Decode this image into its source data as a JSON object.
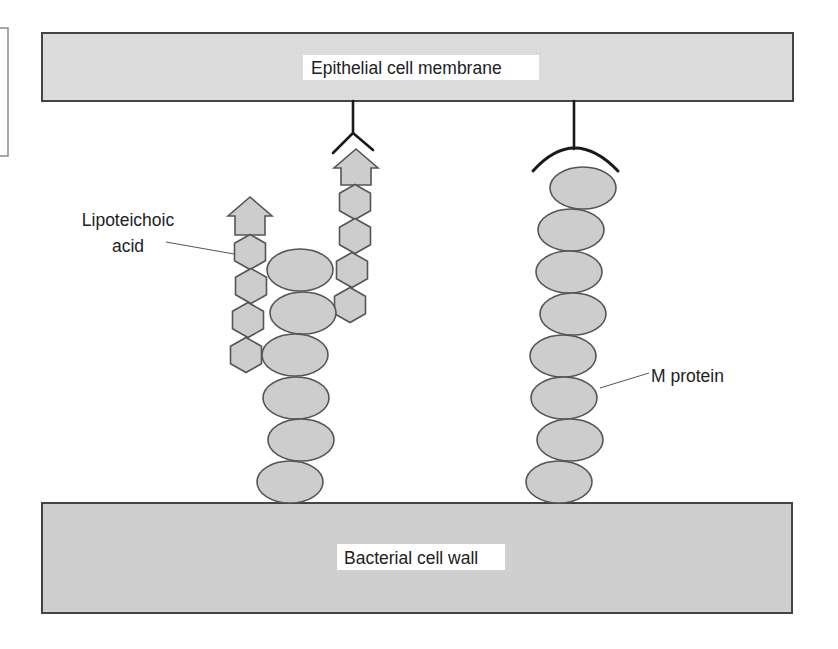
{
  "diagram": {
    "type": "biological-schematic",
    "colors": {
      "background": "#ffffff",
      "membrane_fill": "#dcdcdc",
      "wall_fill": "#cfcfcf",
      "box_stroke": "#444444",
      "subunit_fill": "#cdcdcd",
      "subunit_stroke": "#555555",
      "receptor_stroke": "#1a1a1a",
      "leader_stroke": "#555555",
      "label_bg": "#ffffff",
      "text": "#222222",
      "side_box_stroke": "#8a8a8a"
    },
    "epithelial_membrane": {
      "label": "Epithelial cell membrane",
      "box": {
        "x": 42,
        "y": 33,
        "w": 751,
        "h": 68
      },
      "label_box": {
        "x": 303,
        "y": 55,
        "w": 236,
        "h": 25
      }
    },
    "bacterial_wall": {
      "label": "Bacterial cell wall",
      "box": {
        "x": 42,
        "y": 503,
        "w": 750,
        "h": 110
      },
      "label_box": {
        "x": 337,
        "y": 544,
        "w": 168,
        "h": 26
      }
    },
    "side_box": {
      "x": -10,
      "y": 28,
      "w": 18,
      "h": 128
    },
    "labels": {
      "lipoteichoic_line1": "Lipoteichoic",
      "lipoteichoic_line2": "acid",
      "m_protein": "M protein"
    },
    "left_stack_ellipses": [
      {
        "cx": 300,
        "cy": 270,
        "rx": 33,
        "ry": 21
      },
      {
        "cx": 303,
        "cy": 313,
        "rx": 33,
        "ry": 21
      },
      {
        "cx": 295,
        "cy": 355,
        "rx": 33,
        "ry": 21
      },
      {
        "cx": 296,
        "cy": 398,
        "rx": 33,
        "ry": 21
      },
      {
        "cx": 301,
        "cy": 440,
        "rx": 33,
        "ry": 21
      },
      {
        "cx": 290,
        "cy": 482,
        "rx": 33,
        "ry": 21
      }
    ],
    "m_protein_ellipses": [
      {
        "cx": 583,
        "cy": 188,
        "rx": 33,
        "ry": 21
      },
      {
        "cx": 571,
        "cy": 230,
        "rx": 33,
        "ry": 21
      },
      {
        "cx": 569,
        "cy": 272,
        "rx": 33,
        "ry": 21
      },
      {
        "cx": 573,
        "cy": 314,
        "rx": 33,
        "ry": 21
      },
      {
        "cx": 563,
        "cy": 356,
        "rx": 33,
        "ry": 21
      },
      {
        "cx": 564,
        "cy": 398,
        "rx": 33,
        "ry": 21
      },
      {
        "cx": 570,
        "cy": 440,
        "rx": 33,
        "ry": 21
      },
      {
        "cx": 559,
        "cy": 482,
        "rx": 33,
        "ry": 21
      }
    ],
    "left_lta_hexagons": [
      {
        "cx": 250,
        "cy": 252
      },
      {
        "cx": 251,
        "cy": 286
      },
      {
        "cx": 248,
        "cy": 320
      },
      {
        "cx": 246,
        "cy": 355
      }
    ],
    "right_lta_hexagons": [
      {
        "cx": 355,
        "cy": 202
      },
      {
        "cx": 355,
        "cy": 236
      },
      {
        "cx": 352,
        "cy": 270
      },
      {
        "cx": 350,
        "cy": 305
      }
    ],
    "left_lta_arrow": {
      "tip_x": 250,
      "tip_y": 197,
      "wing_y": 216,
      "half_wing": 22,
      "half_stem": 15,
      "base_y": 235
    },
    "right_lta_arrow": {
      "tip_x": 356,
      "tip_y": 149,
      "wing_y": 168,
      "half_wing": 22,
      "half_stem": 15,
      "base_y": 185
    },
    "y_receptor": {
      "stem_x": 353,
      "top_y": 101,
      "fork_y": 133,
      "left_arm": [
        333,
        153
      ],
      "right_arm": [
        373,
        150
      ]
    },
    "arc_receptor": {
      "stem_x": 574,
      "top_y": 101,
      "fork_y": 149,
      "left_end": [
        533,
        171
      ],
      "right_end": [
        618,
        171
      ]
    },
    "leaders": {
      "lipoteichoic": [
        166,
        242,
        234,
        254
      ],
      "m_protein": [
        600,
        388,
        649,
        373
      ]
    }
  }
}
